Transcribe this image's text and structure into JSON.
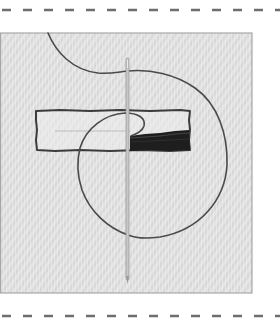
{
  "illustration": {
    "subject": "needle-and-thread-stitching",
    "colors": {
      "page_background": "#ffffff",
      "fabric_background": "#e3e3e3",
      "fabric_texture": "#d2d2d2",
      "fabric_border": "#a8a8a8",
      "cut_line": "#6e6e6e",
      "thread": "#4a4a4a",
      "stitch_outline": "#3c3c3c",
      "filled_stitches": "#1e1e1e",
      "needle": "#bdbdbd",
      "needle_edge": "#8a8a8a"
    },
    "elements": [
      {
        "name": "top-cut-line",
        "style": "dashed"
      },
      {
        "name": "fabric-swatch",
        "style": "textured-square"
      },
      {
        "name": "outlined-rectangle",
        "style": "running-stitch-outline"
      },
      {
        "name": "satin-stitch-fill",
        "style": "dense-dark-fill"
      },
      {
        "name": "thread-loop",
        "style": "curved-line"
      },
      {
        "name": "needle",
        "style": "vertical-needle"
      },
      {
        "name": "bottom-cut-line",
        "style": "dashed"
      }
    ]
  }
}
